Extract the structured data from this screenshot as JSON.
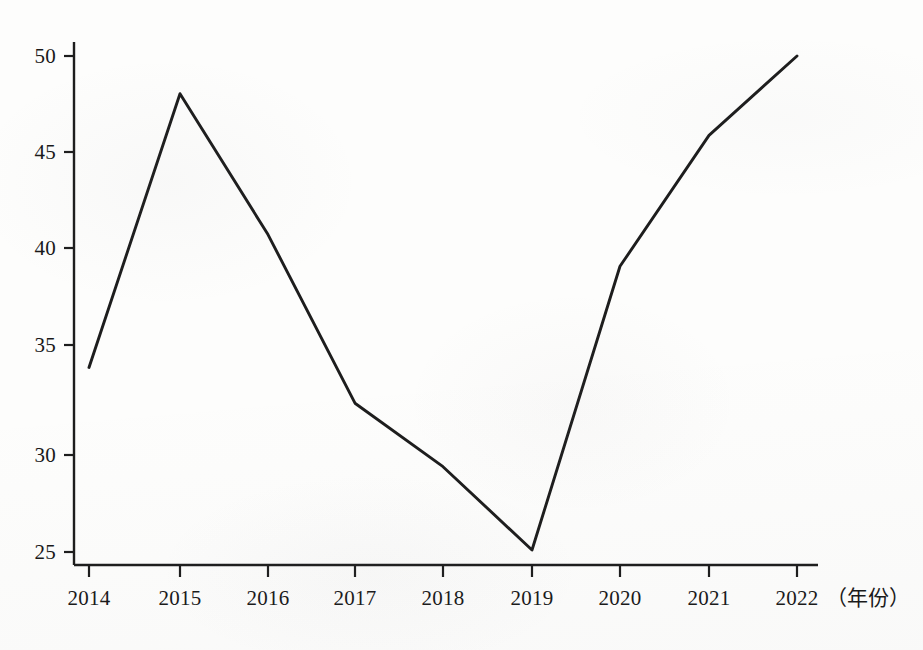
{
  "figure": {
    "background_color": "#fdfdfc",
    "line_color": "#1d1d1d",
    "axis_color": "#1d1d1d",
    "x_axis_title": "（年份）"
  },
  "axes": {
    "y_tick_labels": [
      "50",
      "45",
      "40",
      "35",
      "30",
      "25"
    ],
    "x_tick_labels": [
      "2014",
      "2015",
      "2016",
      "2017",
      "2018",
      "2019",
      "2020",
      "2021",
      "2022"
    ]
  },
  "chart_data": {
    "type": "line",
    "title": "",
    "subtitle": "",
    "xlabel": "（年份）",
    "ylabel": "",
    "categories": [
      "2014",
      "2015",
      "2016",
      "2017",
      "2018",
      "2019",
      "2020",
      "2021",
      "2022"
    ],
    "x": [
      2014,
      2015,
      2016,
      2017,
      2018,
      2019,
      2020,
      2021,
      2022
    ],
    "values": [
      34.3,
      48.1,
      41.0,
      32.5,
      29.3,
      25.1,
      39.4,
      46.0,
      50.0
    ],
    "series": [
      {
        "name": "",
        "values": [
          34.3,
          48.1,
          41.0,
          32.5,
          29.3,
          25.1,
          39.4,
          46.0,
          50.0
        ]
      }
    ],
    "xlim": [
      2014,
      2022
    ],
    "ylim": [
      24.0,
      51.0
    ],
    "yticks": [
      25,
      30,
      35,
      40,
      45,
      50
    ],
    "xticks": [
      2014,
      2015,
      2016,
      2017,
      2018,
      2019,
      2020,
      2021,
      2022
    ],
    "grid": false,
    "legend": false,
    "legend_position": "none",
    "markers": false,
    "annotations": []
  }
}
